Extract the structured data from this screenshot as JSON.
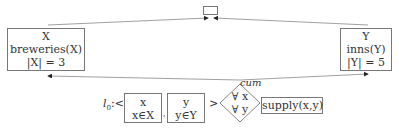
{
  "diagram": {
    "top_node": {
      "label": ""
    },
    "node_x": {
      "var": "X",
      "predicate": "breweries(X)",
      "cardinality": "|X| = 3"
    },
    "node_y": {
      "var": "Y",
      "predicate": "inns(Y)",
      "cardinality": "|Y| = 5"
    },
    "edge_label": "cum",
    "tuple": {
      "prefix": "l",
      "prefix_sub": "0",
      "prefix_tail": ":<",
      "items": [
        {
          "var": "x",
          "constraint": "x∈X"
        },
        {
          "var": "y",
          "constraint": "y∈Y"
        }
      ],
      "separator": ",",
      "close": ">"
    },
    "quantifier": {
      "line1": "∀ x",
      "line2": "∀ y"
    },
    "relation": {
      "label": "supply(x,y)"
    }
  }
}
